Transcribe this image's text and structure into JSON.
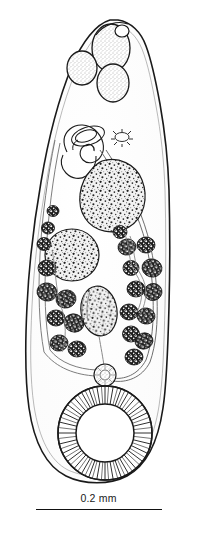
{
  "figure": {
    "background_color": "#ffffff",
    "ink_color": "#1a1a1a",
    "width_px": 197,
    "height_px": 535
  },
  "scale_bar": {
    "label": "0.2 mm",
    "length_px": 126,
    "represents": "0.2 mm",
    "line_color": "#111111",
    "position": "bottom-center"
  },
  "anatomy": {
    "body_outline": {
      "name": "body-outline",
      "description": "Elongate pyriform body, narrow pointed anterior, broadly rounded posterior"
    },
    "structures": [
      {
        "name": "oral-sucker",
        "label": "oral sucker",
        "fill": "stipple"
      },
      {
        "name": "pharynx",
        "label": "pharynx",
        "fill": "stipple"
      },
      {
        "name": "esophagus-bulb",
        "label": "esophageal bulb",
        "fill": "stipple"
      },
      {
        "name": "cirrus-sac",
        "label": "cirrus sac / seminal vesicle",
        "fill": "outline"
      },
      {
        "name": "excretory-pore",
        "label": "excretory pore",
        "fill": "outline"
      },
      {
        "name": "anterior-testis",
        "label": "anterior testis",
        "fill": "mottled"
      },
      {
        "name": "posterior-testis",
        "label": "posterior testis",
        "fill": "mottled"
      },
      {
        "name": "ovary",
        "label": "ovary",
        "fill": "mottled"
      },
      {
        "name": "vitelline-follicles",
        "label": "vitelline follicles",
        "fill": "dark-granular"
      },
      {
        "name": "ootype-rosette",
        "label": "ootype / Mehlis gland",
        "fill": "stipple"
      },
      {
        "name": "ventral-sucker",
        "label": "ventral sucker (acetabulum)",
        "fill": "radial-striations"
      },
      {
        "name": "intestinal-caeca",
        "label": "intestinal caeca",
        "fill": "outline"
      }
    ]
  }
}
